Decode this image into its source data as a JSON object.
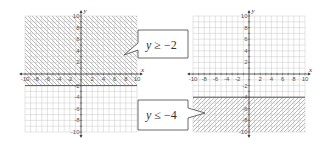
{
  "chart_data": [
    {
      "type": "area",
      "title": "",
      "inequality": "y ≥ −2",
      "boundary": {
        "y": -2,
        "line": "solid"
      },
      "shaded_region": "above",
      "hatch_direction": "backslash",
      "xlabel": "x",
      "ylabel": "y",
      "xlim": [
        -10,
        10
      ],
      "ylim": [
        -10,
        10
      ],
      "x_ticks": [
        -10,
        -8,
        -6,
        -4,
        -2,
        2,
        4,
        6,
        8,
        10
      ],
      "y_ticks": [
        10,
        8,
        6,
        4,
        2,
        -2,
        -4,
        -6,
        -8,
        -10
      ],
      "grid": true
    },
    {
      "type": "area",
      "title": "",
      "inequality": "y ≤ −4",
      "boundary": {
        "y": -4,
        "line": "solid"
      },
      "shaded_region": "below",
      "hatch_direction": "slash",
      "xlabel": "x",
      "ylabel": "y",
      "xlim": [
        -10,
        10
      ],
      "ylim": [
        -10,
        10
      ],
      "x_ticks": [
        -10,
        -8,
        -6,
        -4,
        -2,
        2,
        4,
        6,
        8,
        10
      ],
      "y_ticks": [
        10,
        8,
        6,
        4,
        2,
        -2,
        -4,
        -6,
        -8,
        -10
      ],
      "grid": true
    }
  ],
  "callouts": {
    "top": {
      "var": "y",
      "rest": " ≥ −2"
    },
    "bottom": {
      "var": "y",
      "rest": " ≤ −4"
    }
  },
  "axes": {
    "x_name": "x",
    "y_name": "y"
  },
  "colors": {
    "grid": "#c8c8c8",
    "hatch": "#9a9a9a",
    "boundary": "#555555",
    "axis": "#444444",
    "callout_border": "#444444"
  }
}
